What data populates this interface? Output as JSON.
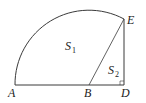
{
  "diagram": {
    "type": "geometry",
    "stroke_color": "#3a3a3a",
    "background": "#ffffff",
    "points": {
      "A": {
        "label": "A",
        "x": 15,
        "y": 85
      },
      "B": {
        "label": "B",
        "x": 89,
        "y": 85
      },
      "D": {
        "label": "D",
        "x": 124,
        "y": 85
      },
      "E": {
        "label": "E",
        "x": 124,
        "y": 20
      }
    },
    "regions": {
      "S1": {
        "main": "S",
        "sub": "1"
      },
      "S2": {
        "main": "S",
        "sub": "2"
      }
    },
    "segments": [
      "AD",
      "BE",
      "ED"
    ],
    "arc": {
      "from": "A",
      "to": "E",
      "center": "B"
    },
    "right_angle_at": "D"
  }
}
